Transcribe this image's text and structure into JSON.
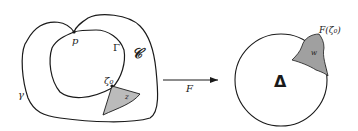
{
  "left_domain": {
    "outer_curve_label": "γ",
    "inner_curve_label": "Γ",
    "region_label": "𝒞",
    "point_p_label": "p",
    "boundary_point_label": "ζ₀",
    "shaded_region_label": "z"
  },
  "mapping": {
    "arrow_label": "F"
  },
  "right_disk": {
    "disk_label": "Δ",
    "image_point_label": "F(ζ₀)",
    "shaded_region_label": "w"
  },
  "colors": {
    "stroke": "#1a1a1a",
    "background": "#ffffff"
  }
}
